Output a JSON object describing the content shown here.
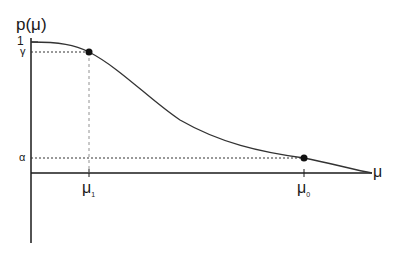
{
  "diagram": {
    "y_axis_label": "p(μ)",
    "x_axis_label": "μ",
    "y_ticks": {
      "one": "1",
      "gamma": "γ",
      "alpha": "α"
    },
    "x_ticks": {
      "mu1": "μ",
      "mu1_sub": "1",
      "mu0": "μ",
      "mu0_sub": "0"
    },
    "points": [
      {
        "name": "mu1-gamma",
        "x": "μ1",
        "y": "γ"
      },
      {
        "name": "mu0-alpha",
        "x": "μ0",
        "y": "α"
      }
    ],
    "colors": {
      "line": "#1a1a1a",
      "curve": "#333333",
      "background": "#ffffff"
    }
  }
}
